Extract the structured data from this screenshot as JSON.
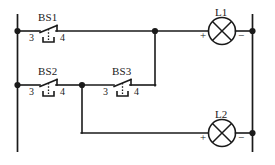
{
  "diagram": {
    "type": "electrical-schematic",
    "line_color": "#1a1a1a",
    "background_color": "#ffffff"
  },
  "switches": [
    {
      "id": "bs1",
      "label": "BS1",
      "terminal_left": "3",
      "terminal_right": "4",
      "kind": "push-button-normally-open",
      "row": "top"
    },
    {
      "id": "bs2",
      "label": "BS2",
      "terminal_left": "3",
      "terminal_right": "4",
      "kind": "push-button-normally-open",
      "row": "middle"
    },
    {
      "id": "bs3",
      "label": "BS3",
      "terminal_left": "3",
      "terminal_right": "4",
      "kind": "push-button-normally-open",
      "row": "middle"
    }
  ],
  "lamps": [
    {
      "id": "l1",
      "label": "L1",
      "terminal_positive": "+",
      "terminal_negative": "−",
      "symbol": "lamp-cross-circle",
      "row": "top"
    },
    {
      "id": "l2",
      "label": "L2",
      "terminal_positive": "+",
      "terminal_negative": "−",
      "symbol": "lamp-cross-circle",
      "row": "bottom"
    }
  ]
}
